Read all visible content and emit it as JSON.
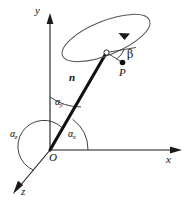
{
  "figure": {
    "kind": "vector-direction-cosine-diagram",
    "background_color": "#ffffff",
    "line_color": "#1a1a1a",
    "vector_color": "#111111",
    "ellipse_color": "#555555",
    "width": 188,
    "height": 202
  },
  "axes": {
    "origin_label": "O",
    "x_label": "x",
    "y_label": "y",
    "z_label": "z"
  },
  "vector": {
    "label": "n"
  },
  "angles": {
    "alpha_x_symbol": "α",
    "alpha_x_sub": "x",
    "alpha_y_symbol": "α",
    "alpha_y_sub": "y",
    "alpha_z_symbol": "α",
    "alpha_z_sub": "z",
    "beta_label": "β"
  },
  "points": {
    "p_label": "P"
  }
}
